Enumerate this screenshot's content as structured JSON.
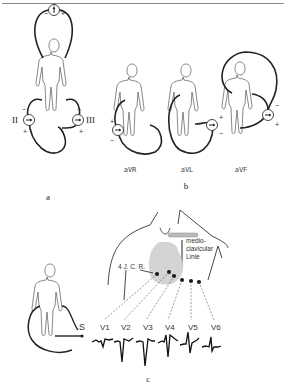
{
  "figure": {
    "panels": {
      "a": {
        "label": "a",
        "leads": [
          {
            "name": "I",
            "neg": "−",
            "pos": "+"
          },
          {
            "name": "II",
            "neg": "−",
            "pos": "+"
          },
          {
            "name": "III",
            "neg": "−",
            "pos": "+"
          }
        ]
      },
      "b": {
        "label": "b",
        "leads": [
          {
            "name": "aVR",
            "neg": "−",
            "pos": "+"
          },
          {
            "name": "aVL",
            "neg": "−",
            "pos": "+"
          },
          {
            "name": "aVF",
            "neg": "−",
            "pos": "+"
          }
        ]
      },
      "c": {
        "label": "c",
        "electrode_label": "S",
        "landmark_label": "4 J. C. R.",
        "midclavicular_label": [
          "medio-",
          "clavicular",
          "Linie"
        ],
        "precordial_leads": [
          "V1",
          "V2",
          "V3",
          "V4",
          "V5",
          "V6"
        ]
      }
    }
  }
}
